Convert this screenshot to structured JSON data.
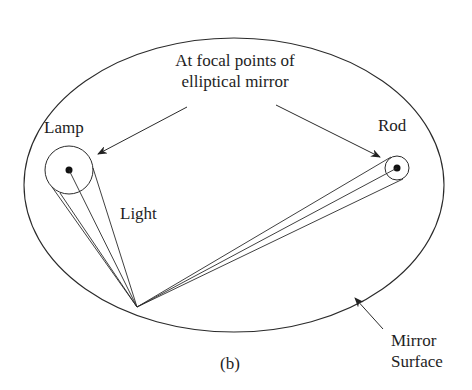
{
  "diagram": {
    "title_annotation_line1": "At focal points of",
    "title_annotation_line2": "elliptical mirror",
    "lamp_label": "Lamp",
    "rod_label": "Rod",
    "light_label": "Light",
    "mirror_label_line1": "Mirror",
    "mirror_label_line2": "Surface",
    "caption": "(b)",
    "colors": {
      "stroke": "#2a2a2a",
      "background": "#ffffff"
    }
  }
}
